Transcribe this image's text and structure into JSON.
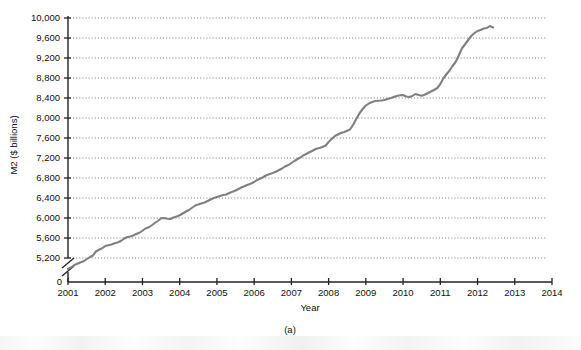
{
  "chart_data": {
    "type": "line",
    "title": "",
    "subtitle": "",
    "caption": "(a)",
    "xlabel": "Year",
    "ylabel": "M2 ($ billions)",
    "xlim": [
      2001,
      2014
    ],
    "ylim": [
      5000,
      10000
    ],
    "y_axis_break": true,
    "y_axis_break_note": "Axis broken between 0 and 5,200",
    "grid": true,
    "grid_style": "dotted-horizontal",
    "legend": "none",
    "line_color": "#808080",
    "xticks": [
      2001,
      2002,
      2003,
      2004,
      2005,
      2006,
      2007,
      2008,
      2009,
      2010,
      2011,
      2012,
      2013,
      2014
    ],
    "xtick_labels": [
      "2001",
      "2002",
      "2003",
      "2004",
      "2005",
      "2006",
      "2007",
      "2008",
      "2009",
      "2010",
      "2011",
      "2012",
      "2013",
      "2014"
    ],
    "yticks": [
      0,
      5200,
      5600,
      6000,
      6400,
      6800,
      7200,
      7600,
      8000,
      8400,
      8800,
      9200,
      9600,
      10000
    ],
    "ytick_labels": [
      "0",
      "5,200",
      "5,600",
      "6,000",
      "6,400",
      "6,800",
      "7,200",
      "7,600",
      "8,000",
      "8,400",
      "8,800",
      "9,200",
      "9,600",
      "10,000"
    ],
    "series": [
      {
        "name": "M2 money supply",
        "x": [
          2001.0,
          2001.08,
          2001.17,
          2001.25,
          2001.33,
          2001.42,
          2001.5,
          2001.58,
          2001.67,
          2001.75,
          2001.83,
          2001.92,
          2002.0,
          2002.08,
          2002.17,
          2002.25,
          2002.33,
          2002.42,
          2002.5,
          2002.58,
          2002.67,
          2002.75,
          2002.83,
          2002.92,
          2003.0,
          2003.08,
          2003.17,
          2003.25,
          2003.33,
          2003.42,
          2003.5,
          2003.58,
          2003.67,
          2003.75,
          2003.83,
          2003.92,
          2004.0,
          2004.08,
          2004.17,
          2004.25,
          2004.33,
          2004.42,
          2004.5,
          2004.58,
          2004.67,
          2004.75,
          2004.83,
          2004.92,
          2005.0,
          2005.08,
          2005.17,
          2005.25,
          2005.33,
          2005.42,
          2005.5,
          2005.58,
          2005.67,
          2005.75,
          2005.83,
          2005.92,
          2006.0,
          2006.08,
          2006.17,
          2006.25,
          2006.33,
          2006.42,
          2006.5,
          2006.58,
          2006.67,
          2006.75,
          2006.83,
          2006.92,
          2007.0,
          2007.08,
          2007.17,
          2007.25,
          2007.33,
          2007.42,
          2007.5,
          2007.58,
          2007.67,
          2007.75,
          2007.83,
          2007.92,
          2008.0,
          2008.08,
          2008.17,
          2008.25,
          2008.33,
          2008.42,
          2008.5,
          2008.58,
          2008.67,
          2008.75,
          2008.83,
          2008.92,
          2009.0,
          2009.08,
          2009.17,
          2009.25,
          2009.33,
          2009.42,
          2009.5,
          2009.58,
          2009.67,
          2009.75,
          2009.83,
          2009.92,
          2010.0,
          2010.08,
          2010.17,
          2010.25,
          2010.33,
          2010.42,
          2010.5,
          2010.58,
          2010.67,
          2010.75,
          2010.83,
          2010.92,
          2011.0,
          2011.08,
          2011.17,
          2011.25,
          2011.33,
          2011.42,
          2011.5,
          2011.58,
          2011.67,
          2011.75,
          2011.83,
          2011.92,
          2012.0,
          2012.08,
          2012.17,
          2012.25,
          2012.33,
          2012.42
        ],
        "values": [
          4980,
          5010,
          5060,
          5085,
          5110,
          5135,
          5175,
          5215,
          5250,
          5330,
          5365,
          5395,
          5440,
          5455,
          5470,
          5495,
          5510,
          5540,
          5585,
          5615,
          5630,
          5650,
          5680,
          5705,
          5745,
          5790,
          5815,
          5855,
          5900,
          5945,
          5995,
          6000,
          5985,
          5980,
          6010,
          6030,
          6055,
          6090,
          6130,
          6160,
          6205,
          6250,
          6270,
          6290,
          6310,
          6340,
          6370,
          6400,
          6420,
          6440,
          6460,
          6470,
          6500,
          6525,
          6550,
          6580,
          6615,
          6640,
          6665,
          6690,
          6720,
          6760,
          6790,
          6820,
          6855,
          6880,
          6900,
          6925,
          6960,
          6990,
          7030,
          7060,
          7100,
          7140,
          7180,
          7215,
          7255,
          7290,
          7320,
          7350,
          7385,
          7400,
          7420,
          7450,
          7520,
          7580,
          7640,
          7670,
          7700,
          7720,
          7745,
          7775,
          7880,
          7990,
          8095,
          8185,
          8250,
          8290,
          8320,
          8340,
          8345,
          8350,
          8360,
          8380,
          8400,
          8420,
          8440,
          8455,
          8460,
          8430,
          8420,
          8440,
          8480,
          8460,
          8445,
          8465,
          8500,
          8530,
          8560,
          8600,
          8680,
          8790,
          8880,
          8950,
          9040,
          9130,
          9260,
          9390,
          9480,
          9560,
          9640,
          9700,
          9740,
          9760,
          9790,
          9800,
          9840,
          9810
        ]
      }
    ]
  },
  "axis": {
    "y_label": "M2 ($ billions)",
    "x_label": "Year",
    "panel_caption": "(a)",
    "zero_label": "0"
  },
  "colors": {
    "line": "#808080",
    "axis": "#222222",
    "grid": "#666666",
    "background": "#ffffff"
  }
}
